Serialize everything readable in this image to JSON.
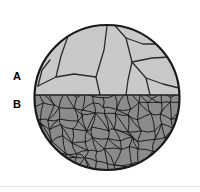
{
  "figure": {
    "kind": "micrograph-diagram",
    "background_color": "#ffffff",
    "divider_color": "#e2e2e2"
  },
  "specimen": {
    "shape": "circle",
    "center_x": 107,
    "center_y": 97.5,
    "radius": 73,
    "outline_color": "#1a1a1a",
    "outline_width": 2.2,
    "boundary_line_y": 95
  },
  "regions": [
    {
      "id": "A",
      "label": "A",
      "name": "coarse-grain-region",
      "position": "top",
      "fill_color": "#c9c9c9",
      "grain_boundary_color": "#2b2b2b",
      "grain_boundary_width": 1.3,
      "grain_count": 9,
      "grain_size": "coarse"
    },
    {
      "id": "B",
      "label": "B",
      "name": "fine-grain-region",
      "position": "bottom",
      "fill_color": "#8b8b8b",
      "grain_boundary_color": "#1f1f1f",
      "grain_boundary_width": 1.0,
      "grain_count": 150,
      "grain_size": "fine"
    }
  ],
  "labels": {
    "region_a": "A",
    "region_b": "B"
  }
}
